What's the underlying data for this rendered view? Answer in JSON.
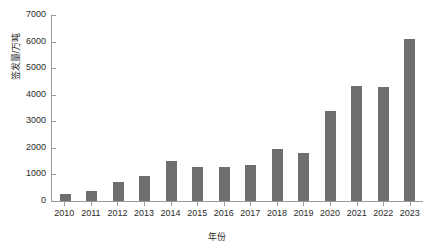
{
  "chart_data": {
    "type": "bar",
    "title": "",
    "xlabel": "年份",
    "ylabel": "签发量/万吨",
    "categories": [
      "2010",
      "2011",
      "2012",
      "2013",
      "2014",
      "2015",
      "2016",
      "2017",
      "2018",
      "2019",
      "2020",
      "2021",
      "2022",
      "2023"
    ],
    "values": [
      250,
      380,
      700,
      950,
      1500,
      1280,
      1270,
      1350,
      1950,
      1820,
      3400,
      4330,
      4280,
      6100
    ],
    "ylim": [
      0,
      7000
    ],
    "yticks": [
      0,
      1000,
      2000,
      3000,
      4000,
      5000,
      6000,
      7000
    ],
    "ytick_labels": [
      "0",
      "1000",
      "2000",
      "3000",
      "4000",
      "5000",
      "6000",
      "7000"
    ],
    "grid": false,
    "legend": "none",
    "bar_color": "#6f6f6f",
    "axis_color": "#9a9a9a",
    "text_color": "#2b2b2b",
    "background": "#ffffff"
  }
}
